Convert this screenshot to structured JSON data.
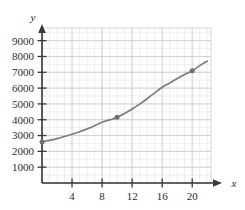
{
  "chart_data": {
    "type": "line",
    "title": "",
    "subtitle": "",
    "xlabel": "x",
    "ylabel": "y",
    "xlim": [
      0,
      22.5
    ],
    "ylim": [
      0,
      9800
    ],
    "xticks": [
      4,
      8,
      12,
      16,
      20
    ],
    "xtick_labels": [
      "4",
      "8",
      "12",
      "16",
      "20"
    ],
    "yticks": [
      1000,
      2000,
      3000,
      4000,
      5000,
      6000,
      7000,
      8000,
      9000
    ],
    "ytick_labels": [
      "1000",
      "2000",
      "3000",
      "4000",
      "5000",
      "6000",
      "7000",
      "8000",
      "9000"
    ],
    "grid": true,
    "grid_minor_x_step": 1,
    "grid_minor_y_step": 500,
    "grid_major_x_step": 4,
    "grid_major_y_step": 1000,
    "legend": null,
    "legend_position": "none",
    "series": [
      {
        "name": "curve",
        "type": "line",
        "color": "#7b7b86",
        "x": [
          0,
          1,
          2,
          3,
          4,
          5,
          6,
          7,
          8,
          9,
          10,
          11,
          12,
          13,
          14,
          15,
          16,
          17,
          18,
          19,
          20,
          21,
          22
        ],
        "y": [
          2600,
          2700,
          2810,
          2940,
          3080,
          3240,
          3420,
          3620,
          3840,
          3990,
          4150,
          4400,
          4680,
          4990,
          5330,
          5700,
          6050,
          6320,
          6600,
          6860,
          7100,
          7420,
          7700
        ]
      }
    ],
    "markers": [
      {
        "x": 0,
        "y": 2600,
        "label": ""
      },
      {
        "x": 10,
        "y": 4150,
        "label": ""
      },
      {
        "x": 20,
        "y": 7100,
        "label": ""
      }
    ],
    "colors": {
      "curve": "#7b7b86",
      "marker": "#6f6f7a",
      "axis": "#3a3a3a",
      "grid_minor": "#e2e2ea",
      "grid_major": "#c9c9d6",
      "text": "#2b2b2b",
      "background": "#ffffff"
    }
  },
  "axis": {
    "y_name": "y",
    "x_name": "x"
  }
}
